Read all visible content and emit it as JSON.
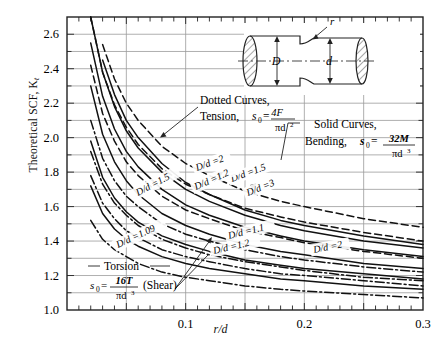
{
  "figure": {
    "y_axis_label": "Theoretical SCF, K",
    "y_axis_label_sub": "t",
    "x_axis_label": "r/d"
  },
  "annotations": {
    "dotted_line1": "Dotted Curves,",
    "dotted_line2": "Tension,",
    "dotted_symbol": "s",
    "dotted_symbol_sub": "0",
    "dotted_eq": "=",
    "dotted_num": "4F",
    "dotted_den": "πd",
    "dotted_den_sup": "2",
    "solid_line1": "Solid Curves,",
    "solid_line2": "Bending,",
    "solid_symbol": "s",
    "solid_symbol_sub": "0",
    "solid_eq": "=",
    "solid_num": "32M",
    "solid_den": "πd",
    "solid_den_sup": "3",
    "torsion_line1": "Torsion",
    "torsion_symbol": "s",
    "torsion_symbol_sub": "0",
    "torsion_eq": "=",
    "torsion_num": "16T",
    "torsion_den": "πd",
    "torsion_den_sup": "3",
    "torsion_shear": "(Shear)"
  },
  "inset": {
    "label_D": "D",
    "label_d": "d",
    "label_r": "r"
  },
  "curve_labels": [
    {
      "text": "D/d =2",
      "x": 197,
      "y": 171,
      "rot": -20
    },
    {
      "text": "D/d =3",
      "x": 248,
      "y": 196,
      "rot": -22
    },
    {
      "text": "D/d =1.5",
      "x": 232,
      "y": 182,
      "rot": -20
    },
    {
      "text": "D/d =1.5",
      "x": 138,
      "y": 196,
      "rot": -28
    },
    {
      "text": "D/d =1.2",
      "x": 196,
      "y": 190,
      "rot": -24
    },
    {
      "text": "D/d =1.1",
      "x": 229,
      "y": 239,
      "rot": -14
    },
    {
      "text": "D/d =1.2",
      "x": 214,
      "y": 254,
      "rot": -13
    },
    {
      "text": "D/d =2",
      "x": 314,
      "y": 253,
      "rot": -11
    },
    {
      "text": "D/d =1.09",
      "x": 118,
      "y": 248,
      "rot": -25
    }
  ],
  "chart_data": {
    "type": "line",
    "xlabel": "r/d",
    "ylabel": "Theoretical SCF, Kt",
    "xlim": [
      0.0,
      0.3
    ],
    "ylim": [
      1.0,
      2.7
    ],
    "xticks": [
      0.1,
      0.2,
      0.3
    ],
    "xticklabels": [
      "0.1",
      "0.2",
      "0.3"
    ],
    "yticks": [
      1.0,
      1.2,
      1.4,
      1.6,
      1.8,
      2.0,
      2.2,
      2.4,
      2.6
    ],
    "yticklabels": [
      "1.0",
      "1.2",
      "1.4",
      "1.6",
      "1.8",
      "2.0",
      "2.2",
      "2.4",
      "2.6"
    ],
    "grid": true,
    "minor_xtick_step": 0.01,
    "minor_ytick_step": 0.1,
    "legend": "none (curves labelled in place)",
    "x": [
      0.02,
      0.03,
      0.04,
      0.05,
      0.06,
      0.08,
      0.1,
      0.12,
      0.15,
      0.18,
      0.2,
      0.25,
      0.3
    ],
    "series": [
      {
        "name": "Bending D/d=3",
        "style": "solid",
        "loading": "bending",
        "values": [
          2.8,
          2.45,
          2.25,
          2.1,
          2.0,
          1.85,
          1.74,
          1.67,
          1.58,
          1.52,
          1.49,
          1.43,
          1.38
        ]
      },
      {
        "name": "Bending D/d=2",
        "style": "solid",
        "loading": "bending",
        "values": [
          2.72,
          2.38,
          2.18,
          2.04,
          1.94,
          1.8,
          1.7,
          1.63,
          1.55,
          1.49,
          1.46,
          1.4,
          1.36
        ]
      },
      {
        "name": "Bending D/d=1.5",
        "style": "solid",
        "loading": "bending",
        "values": [
          2.55,
          2.24,
          2.05,
          1.92,
          1.83,
          1.7,
          1.61,
          1.55,
          1.48,
          1.43,
          1.4,
          1.35,
          1.31
        ]
      },
      {
        "name": "Bending D/d=1.2",
        "style": "solid",
        "loading": "bending",
        "values": [
          2.3,
          2.02,
          1.86,
          1.75,
          1.67,
          1.56,
          1.49,
          1.44,
          1.38,
          1.34,
          1.32,
          1.27,
          1.24
        ]
      },
      {
        "name": "Bending D/d=1.1",
        "style": "solid",
        "loading": "bending",
        "values": [
          1.98,
          1.77,
          1.65,
          1.57,
          1.51,
          1.43,
          1.38,
          1.34,
          1.29,
          1.26,
          1.24,
          1.21,
          1.18
        ]
      },
      {
        "name": "Bending D/d=1.05",
        "style": "solid",
        "loading": "bending",
        "values": [
          1.72,
          1.56,
          1.47,
          1.41,
          1.37,
          1.31,
          1.27,
          1.24,
          1.21,
          1.18,
          1.17,
          1.14,
          1.12
        ]
      },
      {
        "name": "Tension D/d=2",
        "style": "dashed",
        "loading": "tension",
        "values": [
          2.88,
          2.54,
          2.34,
          2.2,
          2.1,
          1.95,
          1.85,
          1.78,
          1.69,
          1.63,
          1.6,
          1.53,
          1.48
        ]
      },
      {
        "name": "Tension D/d=1.5",
        "style": "dashed",
        "loading": "tension",
        "values": [
          2.7,
          2.38,
          2.19,
          2.06,
          1.96,
          1.82,
          1.73,
          1.67,
          1.59,
          1.54,
          1.51,
          1.45,
          1.4
        ]
      },
      {
        "name": "Tension D/d=1.2",
        "style": "dashed",
        "loading": "tension",
        "values": [
          2.42,
          2.14,
          1.98,
          1.86,
          1.78,
          1.66,
          1.58,
          1.53,
          1.46,
          1.42,
          1.39,
          1.34,
          1.3
        ]
      },
      {
        "name": "Torsion D/d=2",
        "style": "dashdot",
        "loading": "torsion",
        "values": [
          2.1,
          1.88,
          1.75,
          1.66,
          1.6,
          1.5,
          1.44,
          1.4,
          1.35,
          1.31,
          1.29,
          1.25,
          1.22
        ]
      },
      {
        "name": "Torsion D/d=1.33",
        "style": "dashdot",
        "loading": "torsion",
        "values": [
          1.92,
          1.73,
          1.62,
          1.55,
          1.49,
          1.41,
          1.36,
          1.32,
          1.28,
          1.25,
          1.23,
          1.19,
          1.17
        ]
      },
      {
        "name": "Torsion D/d=1.2",
        "style": "dashdot",
        "loading": "torsion",
        "values": [
          1.78,
          1.62,
          1.53,
          1.46,
          1.42,
          1.35,
          1.31,
          1.28,
          1.24,
          1.21,
          1.2,
          1.17,
          1.14
        ]
      },
      {
        "name": "Torsion D/d=1.09",
        "style": "dashdot",
        "loading": "torsion",
        "values": [
          1.52,
          1.41,
          1.35,
          1.31,
          1.27,
          1.22,
          1.19,
          1.17,
          1.14,
          1.12,
          1.11,
          1.09,
          1.07
        ]
      }
    ]
  }
}
